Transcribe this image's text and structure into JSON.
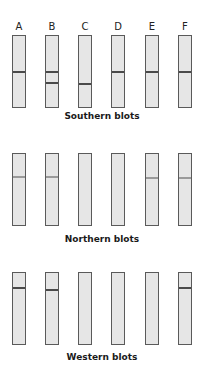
{
  "figure": {
    "lane_labels": [
      "A",
      "B",
      "C",
      "D",
      "E",
      "F"
    ],
    "lane_x": [
      12,
      45,
      78,
      111,
      145,
      178
    ],
    "label_top": 22,
    "colors": {
      "lane_fill": "#e6e6e6",
      "lane_border": "#5a5a5a",
      "band_dark": "#4a4a4a",
      "band_light": "#9a9a9a"
    },
    "panels": [
      {
        "title": "Southern blots",
        "lane_top": 35,
        "lane_height": 71,
        "title_top": 111,
        "band_color": "#4a4a4a",
        "bands": {
          "A": [
            36
          ],
          "B": [
            36,
            47
          ],
          "C": [
            48
          ],
          "D": [
            36
          ],
          "E": [
            36
          ],
          "F": [
            36
          ]
        }
      },
      {
        "title": "Northern blots",
        "lane_top": 153,
        "lane_height": 71,
        "title_top": 234,
        "band_color": "#9a9a9a",
        "bands": {
          "A": [
            23
          ],
          "B": [
            23
          ],
          "C": [],
          "D": [],
          "E": [
            24
          ],
          "F": [
            24
          ]
        }
      },
      {
        "title": "Western blots",
        "lane_top": 272,
        "lane_height": 71,
        "title_top": 352,
        "band_color": "#4a4a4a",
        "bands": {
          "A": [
            15
          ],
          "B": [
            17
          ],
          "C": [],
          "D": [],
          "E": [],
          "F": [
            15
          ]
        }
      }
    ]
  }
}
